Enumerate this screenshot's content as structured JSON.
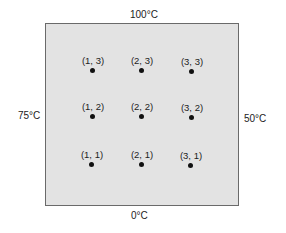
{
  "diagram": {
    "boundary_labels": {
      "top": "100°C",
      "bottom": "0°C",
      "left": "75°C",
      "right": "50°C"
    },
    "nodes": [
      {
        "label": "(1, 3)",
        "x": 73,
        "y": 55
      },
      {
        "label": "(2, 3)",
        "x": 122,
        "y": 55
      },
      {
        "label": "(3, 3)",
        "x": 172,
        "y": 56
      },
      {
        "label": "(1, 2)",
        "x": 73,
        "y": 101
      },
      {
        "label": "(2, 2)",
        "x": 122,
        "y": 101
      },
      {
        "label": "(3, 2)",
        "x": 172,
        "y": 102
      },
      {
        "label": "(1, 1)",
        "x": 72,
        "y": 149
      },
      {
        "label": "(2, 1)",
        "x": 122,
        "y": 149
      },
      {
        "label": "(3, 1)",
        "x": 171,
        "y": 150
      }
    ],
    "colors": {
      "plate_fill": "#e3e3e3",
      "plate_border": "#6a6a6a",
      "dot": "#111111"
    }
  }
}
